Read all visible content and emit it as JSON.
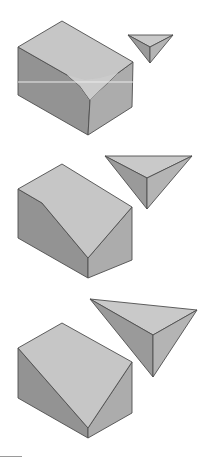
{
  "diagram": {
    "type": "solid-truncation-sequence",
    "colors": {
      "top_face": "#c6c6c6",
      "cut_face": "#cbcbcb",
      "left_face": "#939393",
      "right_face": "#acacac",
      "tet_top": "#c9c9c9",
      "tet_left": "#9a9a9a",
      "tet_right": "#b4b4b4",
      "edge": "#4e4e4e",
      "highlight_line": "#ececec"
    },
    "steps": [
      {
        "label": "step-1-small-cut",
        "block": {
          "top_face": "18,47 62,21 133,62 118,73 100,90 90,100 80,86 67,75",
          "left_face": "18,47 67,75 80,86 90,100 88,135 18,95",
          "right_face": "90,100 100,90 118,73 133,62 132,107 88,135",
          "cut_face": "67,75 80,86 90,100 100,90 118,73 100,78 85,80"
        },
        "tetra": {
          "top": "128,35 173,35 150,47",
          "left": "128,35 150,47 150,63",
          "right": "173,35 150,47 150,63"
        },
        "highlight_y": 82
      },
      {
        "label": "step-2-medium-cut",
        "block": {
          "top_face": "18,189 62,164 132,207 88,258 42,203",
          "left_face": "18,189 42,203 88,258 88,278 18,238",
          "right_face": "88,258 132,207 132,260 88,278"
        },
        "tetra": {
          "top": "105,156 192,156 147,178",
          "left": "105,156 147,178 147,209",
          "right": "192,156 147,178 147,209"
        }
      },
      {
        "label": "step-3-large-cut",
        "block": {
          "top_face": "18,348 62,323 132,362 88,428",
          "left_face": "18,348 88,428 88,438 18,398",
          "right_face": "88,428 132,362 132,413 88,438"
        },
        "tetra": {
          "top": "90,299 197,310 153,335",
          "left": "90,299 153,335 153,377",
          "right": "197,310 153,335 153,377"
        }
      }
    ]
  }
}
